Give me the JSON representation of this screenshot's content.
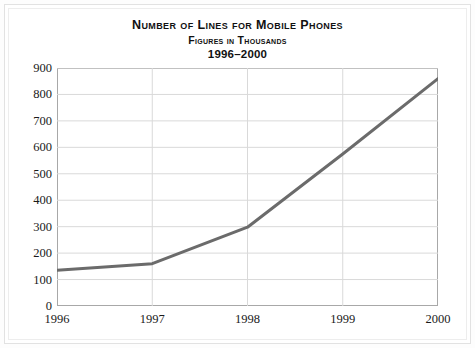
{
  "chart_data": {
    "type": "line",
    "title": "Number of Lines for Mobile Phones",
    "subtitle": "Figures in Thousands",
    "period": "1996–2000",
    "xlabel": "",
    "ylabel": "",
    "categories": [
      "1996",
      "1997",
      "1998",
      "1999",
      "2000"
    ],
    "values": [
      135,
      160,
      298,
      575,
      860
    ],
    "series": [
      {
        "name": "Lines for mobile phones",
        "values": [
          135,
          160,
          298,
          575,
          860
        ]
      }
    ],
    "ylim": [
      0,
      900
    ],
    "yticks": [
      0,
      100,
      200,
      300,
      400,
      500,
      600,
      700,
      800,
      900
    ],
    "ytick_labels": [
      "0",
      "100",
      "200",
      "300",
      "400",
      "500",
      "600",
      "700",
      "800",
      "900"
    ],
    "xticks": [
      "1996",
      "1997",
      "1998",
      "1999",
      "2000"
    ],
    "grid": true,
    "grid_color": "#d9d9d9",
    "legend": false,
    "line_color": "#6b6b6b",
    "line_width": 3,
    "plot_border_color": "#a8a8a8",
    "background_color": "#ffffff"
  }
}
